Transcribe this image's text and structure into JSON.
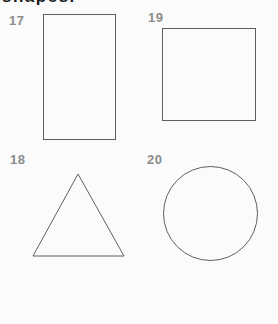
{
  "page": {
    "heading_fragment": "shapes.",
    "background_color": "#fbfbfb",
    "heading_color": "#1d1d1d"
  },
  "colors": {
    "item_number": "#8c8c8c",
    "shape_outline": "#5f5f5f"
  },
  "items": [
    {
      "number": "17",
      "shape": "rectangle"
    },
    {
      "number": "19",
      "shape": "square"
    },
    {
      "number": "18",
      "shape": "triangle"
    },
    {
      "number": "20",
      "shape": "circle"
    }
  ]
}
